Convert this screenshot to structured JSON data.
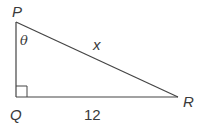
{
  "figure": {
    "type": "right-triangle",
    "vertices": {
      "P": {
        "label": "P",
        "x": 16,
        "y": 22
      },
      "Q": {
        "label": "Q",
        "x": 16,
        "y": 97
      },
      "R": {
        "label": "R",
        "x": 178,
        "y": 97
      }
    },
    "right_angle_at": "Q",
    "angle_label": "θ",
    "angle_at": "P",
    "sides": {
      "hypotenuse_PR": {
        "label": "x"
      },
      "base_QR": {
        "label": "12"
      }
    },
    "colors": {
      "stroke": "#444444",
      "text": "#3a3a3a",
      "background": "#ffffff"
    }
  }
}
